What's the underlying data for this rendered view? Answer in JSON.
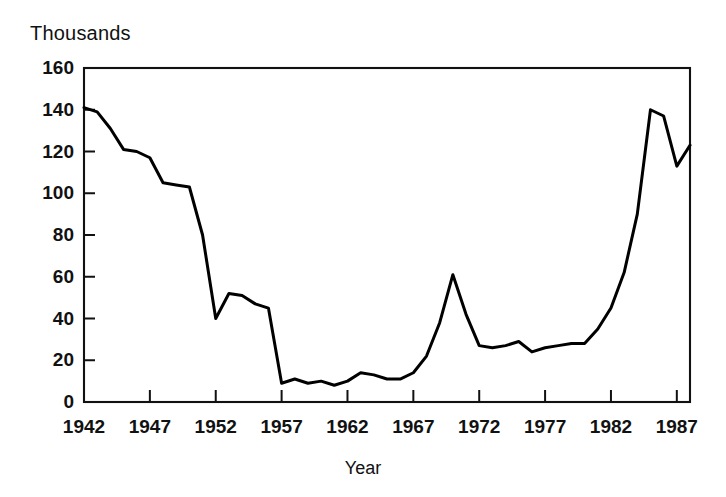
{
  "figure": {
    "unit_label": "Thousands",
    "xaxis_title": "Year"
  },
  "chart_data": {
    "type": "line",
    "title": "",
    "subtitle": "",
    "xlabel": "Year",
    "ylabel": "Thousands",
    "grid": false,
    "legend": "none",
    "xlim": [
      1942,
      1988
    ],
    "ylim": [
      0,
      160
    ],
    "xticks": [
      1942,
      1947,
      1952,
      1957,
      1962,
      1967,
      1972,
      1977,
      1982,
      1987
    ],
    "xtick_labels": [
      "1942",
      "1947",
      "1952",
      "1957",
      "1962",
      "1967",
      "1972",
      "1977",
      "1982",
      "1987"
    ],
    "yticks": [
      0,
      20,
      40,
      60,
      80,
      100,
      120,
      140,
      160
    ],
    "ytick_labels": [
      "0",
      "20",
      "40",
      "60",
      "80",
      "100",
      "120",
      "140",
      "160"
    ],
    "series": [
      {
        "name": "Value",
        "x": [
          1942,
          1943,
          1944,
          1945,
          1946,
          1947,
          1948,
          1949,
          1950,
          1951,
          1952,
          1953,
          1954,
          1955,
          1956,
          1957,
          1958,
          1959,
          1960,
          1961,
          1962,
          1963,
          1964,
          1965,
          1966,
          1967,
          1968,
          1969,
          1970,
          1971,
          1972,
          1973,
          1974,
          1975,
          1976,
          1977,
          1978,
          1979,
          1980,
          1981,
          1982,
          1983,
          1984,
          1985,
          1986,
          1987,
          1988
        ],
        "values": [
          141,
          139,
          131,
          121,
          120,
          117,
          105,
          104,
          103,
          80,
          40,
          52,
          51,
          47,
          45,
          9,
          11,
          9,
          10,
          8,
          10,
          14,
          13,
          11,
          11,
          14,
          22,
          38,
          61,
          42,
          27,
          26,
          27,
          29,
          24,
          26,
          27,
          28,
          28,
          35,
          45,
          62,
          90,
          140,
          137,
          113,
          123
        ]
      }
    ]
  }
}
